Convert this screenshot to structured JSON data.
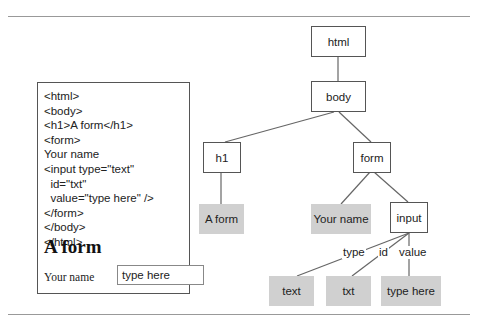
{
  "code_listing": {
    "lines": [
      "<html>",
      "<body>",
      "<h1>A form</h1>",
      "<form>",
      "Your name",
      "<input type=\"text\"",
      "  id=\"txt\"",
      "  value=\"type here\" />",
      "</form>",
      "</body>",
      "</html>"
    ]
  },
  "rendered_preview": {
    "heading": "A form",
    "field_label": "Your name",
    "input_value": "type here"
  },
  "dom_tree": {
    "nodes": {
      "html": "html",
      "body": "body",
      "h1": "h1",
      "form": "form",
      "h1_text": "A form",
      "form_text": "Your name",
      "input": "input",
      "attr_type_value": "text",
      "attr_id_value": "txt",
      "attr_value_value": "type here"
    },
    "edge_labels": {
      "type": "type",
      "id": "id",
      "value": "value"
    }
  },
  "colors": {
    "element_border": "#555555",
    "text_node_fill": "#d0d0d0",
    "rule": "#999999"
  }
}
